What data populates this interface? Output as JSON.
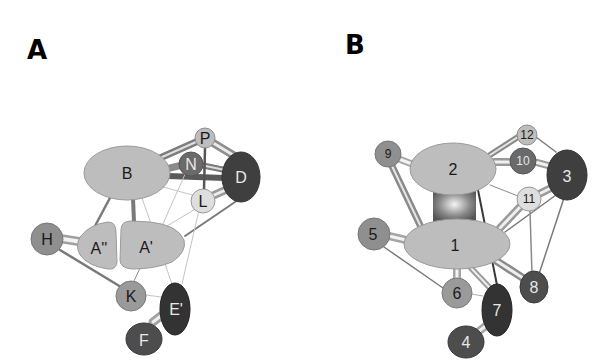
{
  "panels": [
    {
      "label": "A",
      "nodes": {
        "B": "B",
        "P": "P",
        "N": "N",
        "D": "D",
        "L": "L",
        "H": "H",
        "A2": "A''",
        "A1": "A'",
        "K": "K",
        "E": "E'",
        "F": "F"
      },
      "edges": [
        [
          "B",
          "P",
          "thick"
        ],
        [
          "B",
          "N",
          "thick"
        ],
        [
          "B",
          "D",
          "thick"
        ],
        [
          "N",
          "P",
          "thick"
        ],
        [
          "P",
          "D",
          "thick"
        ],
        [
          "N",
          "D",
          "thick"
        ],
        [
          "P",
          "L",
          "medium"
        ],
        [
          "L",
          "D",
          "thick"
        ],
        [
          "B",
          "L",
          "thin"
        ],
        [
          "B",
          "A2",
          "medium"
        ],
        [
          "B",
          "A1",
          "thick"
        ],
        [
          "H",
          "A2",
          "thick"
        ],
        [
          "H",
          "K",
          "medium"
        ],
        [
          "A1",
          "D",
          "medium"
        ],
        [
          "A1",
          "N",
          "thin"
        ],
        [
          "A1",
          "K",
          "thin"
        ],
        [
          "A1",
          "E",
          "thin"
        ],
        [
          "B",
          "E",
          "thin"
        ],
        [
          "L",
          "E",
          "thin"
        ],
        [
          "K",
          "E",
          "thin"
        ],
        [
          "E",
          "F",
          "thick"
        ],
        [
          "A1",
          "L",
          "thin"
        ]
      ]
    },
    {
      "label": "B",
      "nodes": {
        "n1": "1",
        "n2": "2",
        "n3": "3",
        "n4": "4",
        "n5": "5",
        "n6": "6",
        "n7": "7",
        "n8": "8",
        "n9": "9",
        "n10": "10",
        "n11": "11",
        "n12": "12"
      },
      "edges": [
        [
          "2",
          "1",
          "block"
        ],
        [
          "2",
          "9",
          "thick"
        ],
        [
          "9",
          "1",
          "thick"
        ],
        [
          "2",
          "12",
          "thick"
        ],
        [
          "2",
          "10",
          "thick"
        ],
        [
          "10",
          "3",
          "thick"
        ],
        [
          "12",
          "3",
          "medium"
        ],
        [
          "2",
          "3",
          "thick"
        ],
        [
          "2",
          "11",
          "thin"
        ],
        [
          "11",
          "3",
          "thick"
        ],
        [
          "11",
          "1",
          "thick"
        ],
        [
          "3",
          "1",
          "medium"
        ],
        [
          "11",
          "8",
          "thin"
        ],
        [
          "3",
          "8",
          "medium"
        ],
        [
          "2",
          "7",
          "medium"
        ],
        [
          "5",
          "1",
          "thick"
        ],
        [
          "5",
          "6",
          "medium"
        ],
        [
          "1",
          "6",
          "thick"
        ],
        [
          "1",
          "7",
          "thick"
        ],
        [
          "1",
          "8",
          "thick"
        ],
        [
          "6",
          "7",
          "thin"
        ],
        [
          "7",
          "4",
          "thick"
        ]
      ]
    }
  ],
  "colors": {
    "light_node": "#bdbdbd",
    "mid_node": "#8f8f8f",
    "dark_node": "#4d4d4d",
    "darkest_node": "#333333",
    "pale_node": "#dcdcdc",
    "edge": "#8a8a8a"
  }
}
